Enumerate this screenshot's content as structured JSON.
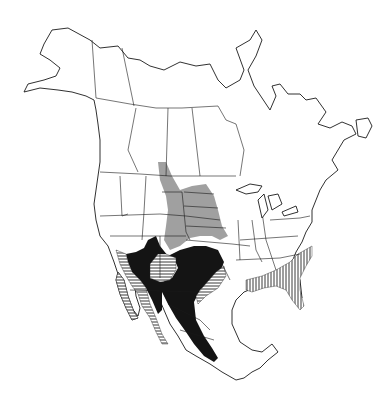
{
  "map": {
    "region": "North America",
    "type": "species range map",
    "legend_visible": false,
    "range_layers": [
      {
        "id": "gray",
        "style": "gray shading",
        "color": "#8f8f8f",
        "area": "northern Great Plains (Saskatchewan/Alberta border south through Dakotas, Nebraska, Kansas)"
      },
      {
        "id": "black",
        "style": "solid black",
        "color": "#141414",
        "area": "southwestern US through Texas and central/western Mexico"
      },
      {
        "id": "hatch-horizontal",
        "style": "horizontal hatching",
        "color": "#222222",
        "area": "Baja California, Sonora coast, Arizona/New Mexico, Texas Gulf coast"
      },
      {
        "id": "hatch-vertical",
        "style": "vertical hatching",
        "color": "#222222",
        "area": "southeastern US coastal plain and Florida"
      }
    ]
  }
}
